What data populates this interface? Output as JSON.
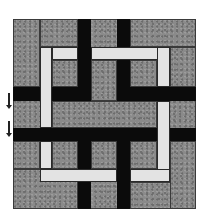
{
  "figure": {
    "type": "woven-lattice quilt block",
    "colors": {
      "gray": "#8a8a8a",
      "black": "#0b0b0b",
      "light": "#e3e3e3",
      "outline": "#3a3a3a"
    },
    "grid": {
      "origin": [
        13,
        19
      ],
      "size": [
        183,
        190
      ],
      "col_edges": [
        13,
        40,
        52,
        78,
        91,
        117,
        130,
        157,
        170,
        196
      ],
      "row_edges": [
        19,
        47,
        60,
        87,
        101,
        128,
        141,
        169,
        182,
        209
      ]
    },
    "side_markers": [
      {
        "name": "down-arrow-upper",
        "x": 9,
        "y1": 93,
        "y2": 107
      },
      {
        "name": "down-arrow-lower",
        "x": 9,
        "y1": 121,
        "y2": 135
      }
    ]
  }
}
